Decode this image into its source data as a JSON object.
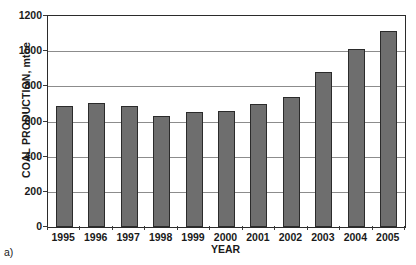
{
  "figure": {
    "caption": "a)"
  },
  "chart_data": {
    "type": "bar",
    "title": "",
    "xlabel": "YEAR",
    "ylabel": "COAL PRODUCTION, mtoe",
    "categories": [
      "1995",
      "1996",
      "1997",
      "1998",
      "1999",
      "2000",
      "2001",
      "2002",
      "2003",
      "2004",
      "2005"
    ],
    "values": [
      687,
      703,
      688,
      629,
      655,
      658,
      702,
      738,
      880,
      1012,
      1112
    ],
    "ylim": [
      0,
      1200
    ],
    "yticks": [
      0,
      200,
      400,
      600,
      800,
      1000,
      1200
    ],
    "ytick_labels": [
      "0",
      "200",
      "400",
      "600",
      "800",
      "1000",
      "1200"
    ],
    "grid": "horizontal",
    "legend": "none",
    "bar_color": "#6e6e6e",
    "bar_edge_color": "#2b2b2b",
    "grid_color": "#8c8c8c",
    "axis_color": "#2b2b2b"
  }
}
